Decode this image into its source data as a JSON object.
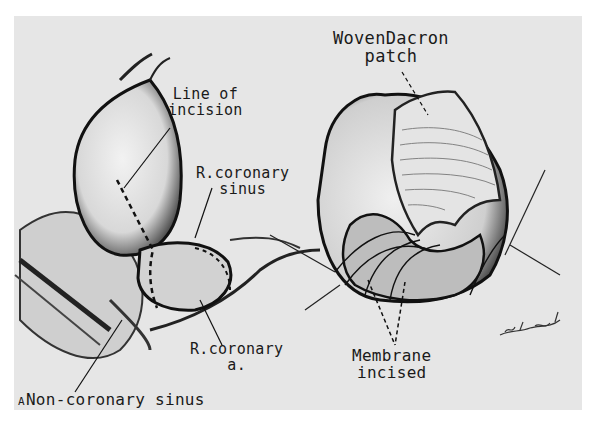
{
  "figure": {
    "panel_letter": "A",
    "labels": {
      "line_of_incision": [
        "Line of",
        "incision"
      ],
      "r_coronary_sinus": [
        "R.coronary",
        "sinus"
      ],
      "r_coronary_a": [
        "R.coronary",
        "a."
      ],
      "non_coronary_sinus": "Non-coronary sinus",
      "woven_dacron_patch": [
        "WovenDacron",
        "patch"
      ],
      "membrane_incised": [
        "Membrane",
        "incised"
      ]
    },
    "signature": "artist-signature",
    "colors": {
      "background": "#ffffff",
      "plate": "#e6e6e6",
      "ink": "#1a1a1a"
    }
  }
}
